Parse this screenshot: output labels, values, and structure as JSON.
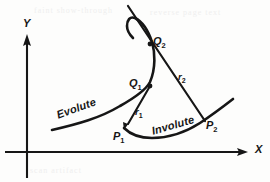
{
  "figure": {
    "kind": "geometry-diagram",
    "background_color": "#fdfdfc",
    "ink_color": "#161616"
  },
  "axes": {
    "x_label": "X",
    "y_label": "Y",
    "x_axis": {
      "x1": 5,
      "y1": 152,
      "x2": 248,
      "y2": 152,
      "arrow": "right"
    },
    "y_axis": {
      "x1": 27,
      "y1": 178,
      "x2": 27,
      "y2": 36,
      "arrow": "up"
    }
  },
  "curves": [
    {
      "name": "Evolute",
      "label": "Evolute",
      "description": "S-shaped locus of centres of curvature rising from lower-left through Q1 to Q2 and beyond",
      "path": "M 52 130 C 78 124 100 118 120 106 C 136 97 146 90 150 82 C 156 68 155 52 152 42 C 148 30 143 22 135 18 C 130 16 127 20 127 26 C 127 30 129 34 133 38"
    },
    {
      "name": "Involute",
      "label": "Involute",
      "description": "U-shaped curve traced from P1 through the lowest point up to P2 and beyond",
      "path": "M 124 128 C 130 134 140 138 152 138 C 168 138 186 132 200 123 C 212 115 224 106 233 99"
    }
  ],
  "tangent_lines": [
    {
      "name": "r2",
      "label": "r",
      "subscript": "2",
      "from_point": "Q2",
      "to_point": "P2",
      "description": "Straight tangent/radius of curvature line from upper-left through Q2 down to P2",
      "path": "M 128 6 L 205 121"
    },
    {
      "name": "r1",
      "label": "r",
      "subscript": "1",
      "from_point": "Q1",
      "to_point": "P1",
      "description": "Tangent/radius of curvature line from Q1 down-left to P1, arrowhead at P1",
      "path": "M 150 86 L 126 127",
      "arrow": "at-P1"
    }
  ],
  "points": [
    {
      "id": "Q2",
      "label": "Q",
      "subscript": "2",
      "x": 150,
      "y": 43,
      "on": "Evolute",
      "marker": true
    },
    {
      "id": "Q1",
      "label": "Q",
      "subscript": "1",
      "x": 150,
      "y": 86,
      "on": "Evolute",
      "marker": true
    },
    {
      "id": "P1",
      "label": "P",
      "subscript": "1",
      "x": 125,
      "y": 128,
      "on": "Involute",
      "marker": false
    },
    {
      "id": "P2",
      "label": "P",
      "subscript": "2",
      "x": 204,
      "y": 121,
      "on": "Involute",
      "marker": false
    }
  ],
  "ghost_text": {
    "line_1": "faint show-through",
    "line_2": "reverse page text",
    "line_3": "scan artifact"
  }
}
